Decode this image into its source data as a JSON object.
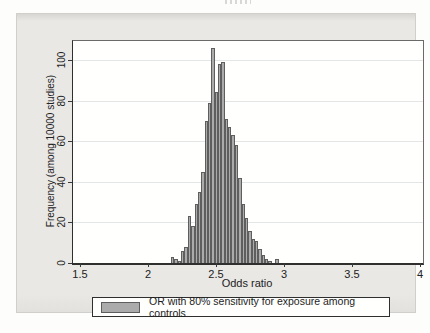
{
  "graph": {
    "ylabel": "Frequency (among 10000 studies)",
    "xlabel": "Odds ratio",
    "legend_label": "OR with 80% sensitivity for exposure among controls"
  },
  "chart_data": {
    "type": "bar",
    "subtype": "histogram",
    "title": "",
    "xlabel": "Odds ratio",
    "ylabel": "Frequency (among 10000 studies)",
    "xlim": [
      1.5,
      4
    ],
    "ylim": [
      0,
      110
    ],
    "x_ticks": [
      1.5,
      2,
      2.5,
      3,
      3.5,
      4
    ],
    "y_ticks": [
      0,
      20,
      40,
      60,
      80,
      100
    ],
    "grid": "horizontal",
    "legend_position": "bottom",
    "legend_entries": [
      "OR with 80% sensitivity for exposure among controls"
    ],
    "bin_start": 2.17,
    "bin_width": 0.025,
    "frequencies": [
      3,
      2,
      1,
      6,
      8,
      23,
      18,
      29,
      35,
      45,
      70,
      79,
      106,
      84,
      98,
      99,
      71,
      67,
      63,
      58,
      42,
      29,
      22,
      16,
      12,
      11,
      7,
      4,
      2,
      1,
      0,
      2
    ],
    "colors": {
      "bar_fill": "#ababab",
      "bar_outline": "#5e5e5e",
      "plot_background": "#fffffe",
      "outer_background": "#e9e8e5",
      "gridline": "#e2e6e6"
    }
  }
}
